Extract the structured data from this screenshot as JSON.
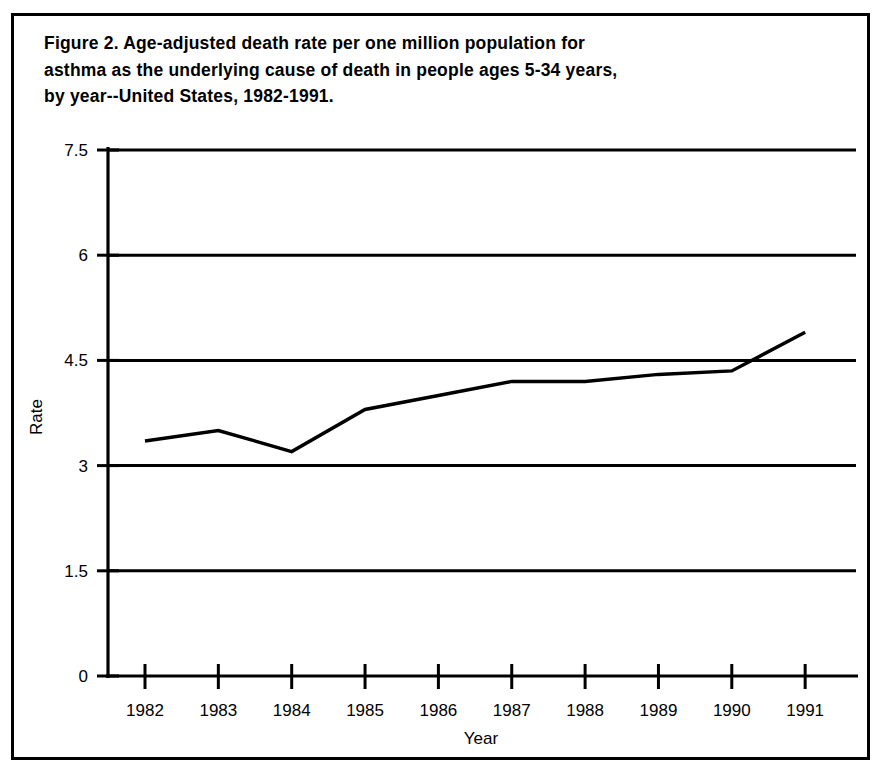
{
  "figure": {
    "caption": "Figure 2.  Age-adjusted death rate per one million population for asthma as the underlying cause of death in people ages 5-34 years, by year--United States, 1982-1991.",
    "caption_line1": "Figure 2.  Age-adjusted death rate per one million population for",
    "caption_line2": "asthma as the underlying cause of death in people ages 5-34 years,",
    "caption_line3": "by year--United States, 1982-1991.",
    "frame_color": "#000000",
    "background_color": "#ffffff"
  },
  "chart_data": {
    "type": "line",
    "title": "Figure 2.  Age-adjusted death rate per one million population for asthma as the underlying cause of death in people ages 5-34 years, by year--United States, 1982-1991.",
    "xlabel": "Year",
    "ylabel": "Rate",
    "x": [
      1982,
      1983,
      1984,
      1985,
      1986,
      1987,
      1988,
      1989,
      1990,
      1991
    ],
    "xtick_labels": [
      "1982",
      "1983",
      "1984",
      "1985",
      "1986",
      "1987",
      "1988",
      "1989",
      "1990",
      "1991"
    ],
    "values": [
      3.35,
      3.5,
      3.2,
      3.8,
      4.0,
      4.2,
      4.2,
      4.3,
      4.35,
      4.9
    ],
    "ytick_labels": [
      "0",
      "1.5",
      "3",
      "4.5",
      "6",
      "7.5"
    ],
    "yticks": [
      0,
      1.5,
      3,
      4.5,
      6,
      7.5
    ],
    "ylim": [
      0,
      7.6
    ],
    "xlim": [
      1981.5,
      1991.7
    ],
    "grid": "horizontal",
    "legend": "none",
    "line_color": "#000000",
    "line_width": 3.4,
    "series_name": "Asthma death rate, ages 5-34"
  }
}
